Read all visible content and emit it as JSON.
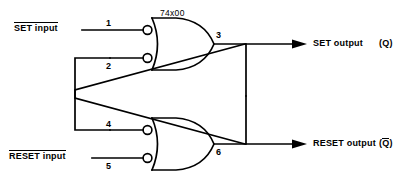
{
  "diagram": {
    "title_chip": "74x00",
    "type": "sr-latch-cross-coupled-nand",
    "inputs": [
      {
        "label": "SET input",
        "overline": true,
        "pin": "1"
      },
      {
        "label": "RESET input",
        "overline": true,
        "pin": "5"
      }
    ],
    "outputs": [
      {
        "label": "SET output",
        "suffix": "(Q)",
        "suffix_overline": false,
        "pin": "3"
      },
      {
        "label": "RESET output",
        "suffix": "(Q)",
        "suffix_overline": true,
        "pin": "6"
      }
    ],
    "pins": {
      "p1": "1",
      "p2": "2",
      "p3": "3",
      "p4": "4",
      "p5": "5",
      "p6": "6"
    },
    "labels": {
      "set_input": "SET input",
      "reset_input": "RESET input",
      "set_output": "SET output",
      "reset_output": "RESET output",
      "q": "Q",
      "qbar": "Q",
      "paren_open": "(",
      "paren_close": ")",
      "chip": "74x00"
    },
    "colors": {
      "line": "#000000",
      "background": "#ffffff",
      "text": "#000000"
    },
    "gates": [
      {
        "name": "upper-nand-gate",
        "inputs": [
          "1",
          "2"
        ],
        "output": "3"
      },
      {
        "name": "lower-nand-gate",
        "inputs": [
          "4",
          "5"
        ],
        "output": "6"
      }
    ]
  }
}
